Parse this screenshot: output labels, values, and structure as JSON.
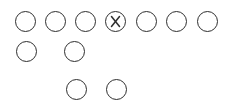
{
  "diagram": {
    "type": "football-formation",
    "stroke_color": "#2e2e2e",
    "background": "#ffffff",
    "circle_diameter": 21,
    "players": [
      {
        "id": "lt-end",
        "row": 1,
        "x": 25.5,
        "y": 21.5,
        "marker": "circle"
      },
      {
        "id": "tackle-left",
        "row": 1,
        "x": 55,
        "y": 21.5,
        "marker": "circle"
      },
      {
        "id": "guard-left",
        "row": 1,
        "x": 85,
        "y": 21.5,
        "marker": "circle"
      },
      {
        "id": "center",
        "row": 1,
        "x": 115.5,
        "y": 21.5,
        "marker": "x-circle"
      },
      {
        "id": "guard-right",
        "row": 1,
        "x": 146,
        "y": 21.5,
        "marker": "circle"
      },
      {
        "id": "tackle-right",
        "row": 1,
        "x": 176.5,
        "y": 21.5,
        "marker": "circle"
      },
      {
        "id": "rt-end",
        "row": 1,
        "x": 207,
        "y": 21.5,
        "marker": "circle"
      },
      {
        "id": "back-left",
        "row": 2,
        "x": 26,
        "y": 51,
        "marker": "circle"
      },
      {
        "id": "back-mid",
        "row": 2,
        "x": 74,
        "y": 51,
        "marker": "circle"
      },
      {
        "id": "back-deep-1",
        "row": 3,
        "x": 76,
        "y": 89.5,
        "marker": "circle"
      },
      {
        "id": "back-deep-2",
        "row": 3,
        "x": 116,
        "y": 89.5,
        "marker": "circle"
      }
    ]
  }
}
